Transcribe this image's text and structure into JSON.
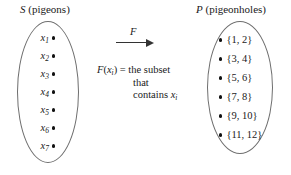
{
  "figure": {
    "background_color": "#ffffff",
    "line_color": "#6e6e6e",
    "text_color": "#1a1a1a"
  },
  "left_set": {
    "symbol": "S",
    "description": "(pigeons)",
    "caption": "S (pigeons)",
    "elements": [
      {
        "base": "x",
        "sub": "1",
        "label": "x1"
      },
      {
        "base": "x",
        "sub": "2",
        "label": "x2"
      },
      {
        "base": "x",
        "sub": "3",
        "label": "x3"
      },
      {
        "base": "x",
        "sub": "4",
        "label": "x4"
      },
      {
        "base": "x",
        "sub": "5",
        "label": "x5"
      },
      {
        "base": "x",
        "sub": "6",
        "label": "x6"
      },
      {
        "base": "x",
        "sub": "7",
        "label": "x7"
      }
    ]
  },
  "right_set": {
    "symbol": "P",
    "description": "(pigeonholes)",
    "caption": "P (pigeonholes)",
    "elements": [
      {
        "label": "{1, 2}"
      },
      {
        "label": "{3, 4}"
      },
      {
        "label": "{5, 6}"
      },
      {
        "label": "{7, 8}"
      },
      {
        "label": "{9, 10}"
      },
      {
        "label": "{11, 12}"
      }
    ]
  },
  "arrow": {
    "label": "F"
  },
  "definition": {
    "function_name": "F",
    "argument_base": "x",
    "argument_sub": "i",
    "open_paren": "(",
    "close_paren": ")",
    "equals": " = ",
    "line1_tail": "the subset",
    "line2": "that",
    "line3_head": "contains ",
    "line3_base": "x",
    "line3_sub": "i",
    "full_text": "F(xi) = the subset that contains xi"
  }
}
